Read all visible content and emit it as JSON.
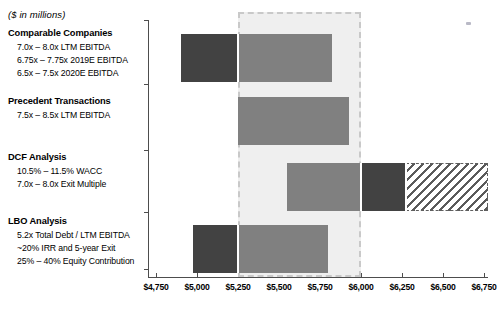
{
  "header": {
    "units_note": "($ in millions)"
  },
  "chart_data": {
    "type": "bar",
    "orientation": "horizontal",
    "title": "",
    "subtitle": "($ in millions)",
    "xlabel": "",
    "ylabel": "",
    "xlim": [
      4750,
      6750
    ],
    "xtick_step": 250,
    "grid": false,
    "legend": "none",
    "tick_labels": [
      "$4,750",
      "$5,000",
      "$5,250",
      "$5,500",
      "$5,750",
      "$6,000",
      "$6,250",
      "$6,500",
      "$6,750"
    ],
    "tick_values": [
      4750,
      5000,
      5250,
      5500,
      5750,
      6000,
      6250,
      6500,
      6750
    ],
    "reference_band": {
      "label": "implied valuation range",
      "low": 5250,
      "high": 6000,
      "fill": "#efefef",
      "border": "#c9c9c9",
      "border_style": "dashed"
    },
    "categories": [
      {
        "name": "Comparable Companies",
        "methods": [
          "7.0x – 8.0x LTM EBITDA",
          "6.75x – 7.75x 2019E EBITDA",
          "6.5x – 7.5x 2020E EBITDA"
        ],
        "low": 4900,
        "high": 5825,
        "segments": [
          {
            "from": 4900,
            "to": 5250,
            "style": "dark"
          },
          {
            "from": 5250,
            "to": 5825,
            "style": "mid"
          }
        ]
      },
      {
        "name": "Precedent Transactions",
        "methods": [
          "7.5x – 8.5x LTM EBITDA"
        ],
        "low": 5250,
        "high": 5925,
        "segments": [
          {
            "from": 5250,
            "to": 5925,
            "style": "mid"
          }
        ]
      },
      {
        "name": "DCF Analysis",
        "methods": [
          "10.5% – 11.5% WACC",
          "7.0x – 8.0x Exit Multiple"
        ],
        "low": 5550,
        "high": 6775,
        "segments": [
          {
            "from": 5550,
            "to": 6000,
            "style": "mid"
          },
          {
            "from": 6000,
            "to": 6275,
            "style": "dark"
          },
          {
            "from": 6275,
            "to": 6775,
            "style": "hatch"
          }
        ]
      },
      {
        "name": "LBO Analysis",
        "methods": [
          "5.2x Total Debt / LTM EBITDA",
          "~20% IRR and 5-year Exit",
          "25% – 40% Equity Contribution"
        ],
        "low": 4975,
        "high": 5800,
        "segments": [
          {
            "from": 4975,
            "to": 5250,
            "style": "dark"
          },
          {
            "from": 5250,
            "to": 5800,
            "style": "mid"
          }
        ]
      }
    ],
    "colors": {
      "dark_segment": "#424242",
      "mid_segment": "#808080",
      "hatch_segment": "#5a5a5a",
      "band_fill": "#efefef",
      "band_border": "#c9c9c9",
      "axis": "#4d4d4d"
    }
  }
}
